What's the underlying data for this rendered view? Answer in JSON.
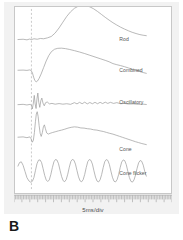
{
  "panel": {
    "letter": "B"
  },
  "axis": {
    "caption": "5ms/div"
  },
  "labels": {
    "rod": "Rod",
    "combined": "Combined",
    "oscillatory": "Oscillatory",
    "cone": "Cone",
    "cone_flicker": "Cone flicker"
  },
  "colors": {
    "trace": "#9a9a9a",
    "frame": "#c8c8c8",
    "card_background": "#f2f2f2",
    "plot_background": "#ffffff",
    "stimulus_line": "#b4b4b4",
    "label_text": "#555555",
    "panel_letter": "#1a1a1a"
  },
  "chart_data": {
    "type": "line",
    "title": "",
    "subtitle": "",
    "xlabel": "5ms/div",
    "ylabel": "",
    "grid": false,
    "legend_position": "right-inline",
    "x_axis": {
      "unit": "ms",
      "division_ms": 5,
      "divisions": 20,
      "range_ms": [
        0,
        100
      ],
      "ruler": true,
      "minor_ticks_per_division": 5
    },
    "annotations": [
      {
        "name": "stimulus-onset",
        "type": "vertical-dashed-line",
        "x_fraction": 0.105,
        "label": ""
      }
    ],
    "series": [
      {
        "name": "Rod",
        "label": "Rod",
        "baseline_y": 0.175,
        "label_x": 0.79,
        "label_y": 0.185,
        "description": "Flat pre-stimulus baseline, slow broad positive b-wave peaking mid-trace then gradual decay",
        "points": [
          [
            0.0,
            0.0
          ],
          [
            0.04,
            0.004
          ],
          [
            0.07,
            -0.004
          ],
          [
            0.09,
            0.006
          ],
          [
            0.105,
            0.0
          ],
          [
            0.125,
            0.01
          ],
          [
            0.15,
            0.004
          ],
          [
            0.175,
            0.014
          ],
          [
            0.2,
            0.01
          ],
          [
            0.23,
            0.022
          ],
          [
            0.26,
            0.04
          ],
          [
            0.29,
            0.085
          ],
          [
            0.32,
            0.15
          ],
          [
            0.35,
            0.225
          ],
          [
            0.38,
            0.3
          ],
          [
            0.41,
            0.36
          ],
          [
            0.44,
            0.405
          ],
          [
            0.47,
            0.432
          ],
          [
            0.5,
            0.444
          ],
          [
            0.53,
            0.44
          ],
          [
            0.56,
            0.424
          ],
          [
            0.59,
            0.398
          ],
          [
            0.62,
            0.364
          ],
          [
            0.65,
            0.326
          ],
          [
            0.68,
            0.288
          ],
          [
            0.71,
            0.252
          ],
          [
            0.74,
            0.218
          ],
          [
            0.77,
            0.188
          ],
          [
            0.8,
            0.16
          ],
          [
            0.83,
            0.136
          ],
          [
            0.86,
            0.114
          ],
          [
            0.89,
            0.094
          ],
          [
            0.92,
            0.078
          ],
          [
            0.95,
            0.064
          ],
          [
            0.975,
            0.056
          ],
          [
            1.0,
            0.05
          ]
        ]
      },
      {
        "name": "Combined",
        "label": "Combined",
        "baseline_y": 0.34,
        "label_x": 0.79,
        "label_y": 0.352,
        "description": "Sharp negative a-wave at stimulus, large positive b-wave, long slow decay below baseline",
        "points": [
          [
            0.0,
            0.0
          ],
          [
            0.04,
            0.002
          ],
          [
            0.07,
            -0.002
          ],
          [
            0.09,
            0.004
          ],
          [
            0.1,
            0.0
          ],
          [
            0.112,
            -0.03
          ],
          [
            0.122,
            -0.09
          ],
          [
            0.132,
            -0.135
          ],
          [
            0.142,
            -0.15
          ],
          [
            0.152,
            -0.14
          ],
          [
            0.165,
            -0.105
          ],
          [
            0.18,
            -0.05
          ],
          [
            0.2,
            0.035
          ],
          [
            0.22,
            0.12
          ],
          [
            0.24,
            0.19
          ],
          [
            0.26,
            0.24
          ],
          [
            0.285,
            0.272
          ],
          [
            0.31,
            0.284
          ],
          [
            0.34,
            0.286
          ],
          [
            0.37,
            0.28
          ],
          [
            0.4,
            0.27
          ],
          [
            0.44,
            0.254
          ],
          [
            0.48,
            0.236
          ],
          [
            0.52,
            0.216
          ],
          [
            0.56,
            0.194
          ],
          [
            0.6,
            0.172
          ],
          [
            0.64,
            0.15
          ],
          [
            0.68,
            0.128
          ],
          [
            0.71,
            0.11
          ],
          [
            0.74,
            0.086
          ],
          [
            0.77,
            0.072
          ],
          [
            0.8,
            0.06
          ],
          [
            0.83,
            0.046
          ],
          [
            0.86,
            0.03
          ],
          [
            0.89,
            0.014
          ],
          [
            0.92,
            -0.002
          ],
          [
            0.95,
            -0.018
          ],
          [
            0.975,
            -0.03
          ],
          [
            1.0,
            -0.04
          ]
        ]
      },
      {
        "name": "Oscillatory",
        "label": "Oscillatory",
        "baseline_y": 0.525,
        "label_x": 0.79,
        "label_y": 0.52,
        "description": "High-frequency oscillatory potentials burst right after stimulus, then low-amplitude ripples",
        "points": [
          [
            0.0,
            0.0
          ],
          [
            0.04,
            0.004
          ],
          [
            0.07,
            -0.004
          ],
          [
            0.095,
            0.004
          ],
          [
            0.105,
            -0.01
          ],
          [
            0.112,
            -0.055
          ],
          [
            0.12,
            0.02
          ],
          [
            0.127,
            0.12
          ],
          [
            0.134,
            0.01
          ],
          [
            0.141,
            -0.05
          ],
          [
            0.148,
            0.075
          ],
          [
            0.155,
            0.15
          ],
          [
            0.162,
            0.03
          ],
          [
            0.17,
            -0.035
          ],
          [
            0.178,
            0.05
          ],
          [
            0.186,
            0.085
          ],
          [
            0.195,
            0.02
          ],
          [
            0.205,
            -0.015
          ],
          [
            0.215,
            0.025
          ],
          [
            0.228,
            0.035
          ],
          [
            0.245,
            0.01
          ],
          [
            0.265,
            0.016
          ],
          [
            0.29,
            0.006
          ],
          [
            0.32,
            0.014
          ],
          [
            0.35,
            0.006
          ],
          [
            0.38,
            0.012
          ],
          [
            0.41,
            0.004
          ],
          [
            0.44,
            0.026
          ],
          [
            0.46,
            0.01
          ],
          [
            0.48,
            0.03
          ],
          [
            0.5,
            0.012
          ],
          [
            0.52,
            0.032
          ],
          [
            0.54,
            0.01
          ],
          [
            0.56,
            0.028
          ],
          [
            0.58,
            0.012
          ],
          [
            0.6,
            0.03
          ],
          [
            0.62,
            0.012
          ],
          [
            0.64,
            0.03
          ],
          [
            0.66,
            0.014
          ],
          [
            0.68,
            0.032
          ],
          [
            0.7,
            0.016
          ],
          [
            0.72,
            0.03
          ],
          [
            0.745,
            0.016
          ],
          [
            0.77,
            0.026
          ],
          [
            0.8,
            0.012
          ],
          [
            0.83,
            0.016
          ],
          [
            0.86,
            0.008
          ],
          [
            0.9,
            0.01
          ],
          [
            0.94,
            0.004
          ],
          [
            0.975,
            0.006
          ],
          [
            1.0,
            0.002
          ]
        ]
      },
      {
        "name": "Cone",
        "label": "Cone",
        "baseline_y": 0.7,
        "label_x": 0.79,
        "label_y": 0.775,
        "description": "Small a-wave then tall sharp b-wave spike, secondary peaks, broad slow decay with fine ripples",
        "points": [
          [
            0.0,
            0.0
          ],
          [
            0.04,
            0.004
          ],
          [
            0.07,
            -0.006
          ],
          [
            0.092,
            0.004
          ],
          [
            0.102,
            -0.02
          ],
          [
            0.112,
            -0.065
          ],
          [
            0.12,
            -0.04
          ],
          [
            0.128,
            0.06
          ],
          [
            0.136,
            0.2
          ],
          [
            0.143,
            0.3
          ],
          [
            0.15,
            0.33
          ],
          [
            0.157,
            0.27
          ],
          [
            0.165,
            0.15
          ],
          [
            0.173,
            0.05
          ],
          [
            0.181,
            0.01
          ],
          [
            0.19,
            0.06
          ],
          [
            0.198,
            0.135
          ],
          [
            0.206,
            0.16
          ],
          [
            0.214,
            0.11
          ],
          [
            0.224,
            0.055
          ],
          [
            0.236,
            0.04
          ],
          [
            0.25,
            0.05
          ],
          [
            0.268,
            0.06
          ],
          [
            0.29,
            0.07
          ],
          [
            0.315,
            0.082
          ],
          [
            0.34,
            0.092
          ],
          [
            0.365,
            0.104
          ],
          [
            0.39,
            0.118
          ],
          [
            0.415,
            0.128
          ],
          [
            0.44,
            0.134
          ],
          [
            0.465,
            0.13
          ],
          [
            0.49,
            0.12
          ],
          [
            0.515,
            0.118
          ],
          [
            0.54,
            0.11
          ],
          [
            0.565,
            0.106
          ],
          [
            0.59,
            0.096
          ],
          [
            0.615,
            0.092
          ],
          [
            0.64,
            0.082
          ],
          [
            0.665,
            0.074
          ],
          [
            0.69,
            0.062
          ],
          [
            0.715,
            0.05
          ],
          [
            0.74,
            0.04
          ],
          [
            0.765,
            0.026
          ],
          [
            0.79,
            0.012
          ],
          [
            0.815,
            -0.002
          ],
          [
            0.84,
            -0.016
          ],
          [
            0.865,
            -0.03
          ],
          [
            0.89,
            -0.044
          ],
          [
            0.915,
            -0.058
          ],
          [
            0.94,
            -0.07
          ],
          [
            0.965,
            -0.082
          ],
          [
            1.0,
            -0.096
          ]
        ]
      },
      {
        "name": "Cone flicker",
        "label": "Cone flicker",
        "baseline_y": 0.905,
        "label_x": 0.79,
        "label_y": 0.905,
        "description": "Regular 30 Hz sinusoidal flicker response, eight repeating peaks of near-constant amplitude",
        "peak_count": 8,
        "points": [
          [
            0.0,
            0.12
          ],
          [
            0.012,
            0.165
          ],
          [
            0.026,
            0.175
          ],
          [
            0.04,
            0.13
          ],
          [
            0.055,
            0.05
          ],
          [
            0.07,
            -0.03
          ],
          [
            0.085,
            -0.072
          ],
          [
            0.1,
            -0.09
          ],
          [
            0.112,
            -0.078
          ],
          [
            0.124,
            -0.03
          ],
          [
            0.136,
            0.06
          ],
          [
            0.148,
            0.15
          ],
          [
            0.16,
            0.196
          ],
          [
            0.172,
            0.2
          ],
          [
            0.184,
            0.165
          ],
          [
            0.196,
            0.085
          ],
          [
            0.208,
            0.0
          ],
          [
            0.22,
            -0.06
          ],
          [
            0.232,
            -0.08
          ],
          [
            0.244,
            -0.06
          ],
          [
            0.256,
            0.01
          ],
          [
            0.268,
            0.1
          ],
          [
            0.28,
            0.175
          ],
          [
            0.292,
            0.205
          ],
          [
            0.304,
            0.198
          ],
          [
            0.316,
            0.15
          ],
          [
            0.328,
            0.065
          ],
          [
            0.34,
            -0.015
          ],
          [
            0.352,
            -0.07
          ],
          [
            0.364,
            -0.082
          ],
          [
            0.376,
            -0.055
          ],
          [
            0.388,
            0.015
          ],
          [
            0.4,
            0.105
          ],
          [
            0.412,
            0.18
          ],
          [
            0.424,
            0.206
          ],
          [
            0.436,
            0.196
          ],
          [
            0.448,
            0.145
          ],
          [
            0.46,
            0.06
          ],
          [
            0.472,
            -0.02
          ],
          [
            0.484,
            -0.072
          ],
          [
            0.496,
            -0.084
          ],
          [
            0.508,
            -0.056
          ],
          [
            0.52,
            0.012
          ],
          [
            0.532,
            0.102
          ],
          [
            0.544,
            0.178
          ],
          [
            0.556,
            0.205
          ],
          [
            0.568,
            0.195
          ],
          [
            0.58,
            0.145
          ],
          [
            0.592,
            0.058
          ],
          [
            0.604,
            -0.022
          ],
          [
            0.616,
            -0.074
          ],
          [
            0.628,
            -0.086
          ],
          [
            0.64,
            -0.058
          ],
          [
            0.652,
            0.01
          ],
          [
            0.664,
            0.1
          ],
          [
            0.676,
            0.176
          ],
          [
            0.688,
            0.204
          ],
          [
            0.7,
            0.194
          ],
          [
            0.712,
            0.142
          ],
          [
            0.724,
            0.055
          ],
          [
            0.736,
            -0.025
          ],
          [
            0.748,
            -0.076
          ],
          [
            0.76,
            -0.086
          ],
          [
            0.772,
            -0.058
          ],
          [
            0.784,
            0.008
          ],
          [
            0.796,
            0.098
          ],
          [
            0.808,
            0.172
          ],
          [
            0.82,
            0.2
          ],
          [
            0.832,
            0.19
          ],
          [
            0.844,
            0.138
          ],
          [
            0.856,
            0.052
          ],
          [
            0.868,
            -0.028
          ],
          [
            0.88,
            -0.078
          ],
          [
            0.892,
            -0.088
          ],
          [
            0.904,
            -0.06
          ],
          [
            0.916,
            0.004
          ],
          [
            0.928,
            0.09
          ],
          [
            0.94,
            0.162
          ],
          [
            0.952,
            0.192
          ],
          [
            0.964,
            0.182
          ],
          [
            0.976,
            0.132
          ],
          [
            0.988,
            0.05
          ],
          [
            1.0,
            -0.01
          ]
        ]
      }
    ]
  }
}
